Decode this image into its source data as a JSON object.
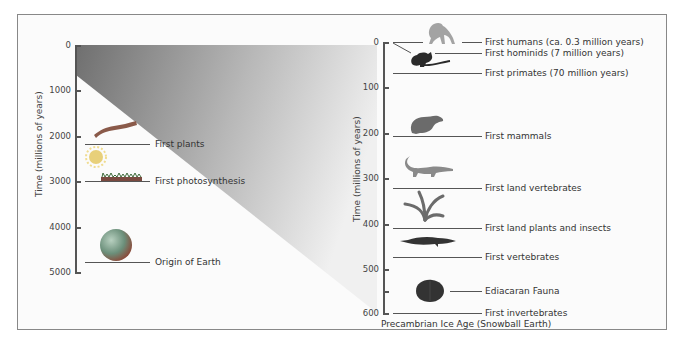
{
  "figure": {
    "left_panel": {
      "axis_title": "Time (millions of years)",
      "ticks": [
        "0",
        "1000",
        "2000",
        "3000",
        "4000",
        "5000"
      ],
      "events": [
        {
          "label": "First plants",
          "icon": "algae-icon"
        },
        {
          "label": "First photosynthesis",
          "icon": "bacteria-mat-icon"
        },
        {
          "label": "Origin of Earth",
          "icon": "earth-icon"
        }
      ]
    },
    "right_panel": {
      "axis_title": "Time (millions of years)",
      "ticks": [
        "0",
        "100",
        "200",
        "300",
        "400",
        "500",
        "600"
      ],
      "events": [
        {
          "label": "First humans (ca. 0.3 million years)",
          "icon": "ape-icon"
        },
        {
          "label": "First hominids (7 million years)",
          "icon": "primate-icon"
        },
        {
          "label": "First primates (70 million years)",
          "icon": ""
        },
        {
          "label": "First mammals",
          "icon": "mammal-icon"
        },
        {
          "label": "First land vertebrates",
          "icon": "amphibian-icon"
        },
        {
          "label": "First land plants and insects",
          "icon": "land-plant-icon"
        },
        {
          "label": "First vertebrates",
          "icon": "fish-icon"
        },
        {
          "label": "Ediacaran Fauna",
          "icon": "ediacaran-icon"
        },
        {
          "label": "First invertebrates",
          "icon": ""
        }
      ],
      "footer": "Precambrian Ice Age (Snowball Earth)"
    },
    "colors": {
      "wedge_dark": "#6f6f6f",
      "wedge_light": "#f2f2f2",
      "axis": "#555555",
      "frame": "#888888"
    }
  }
}
